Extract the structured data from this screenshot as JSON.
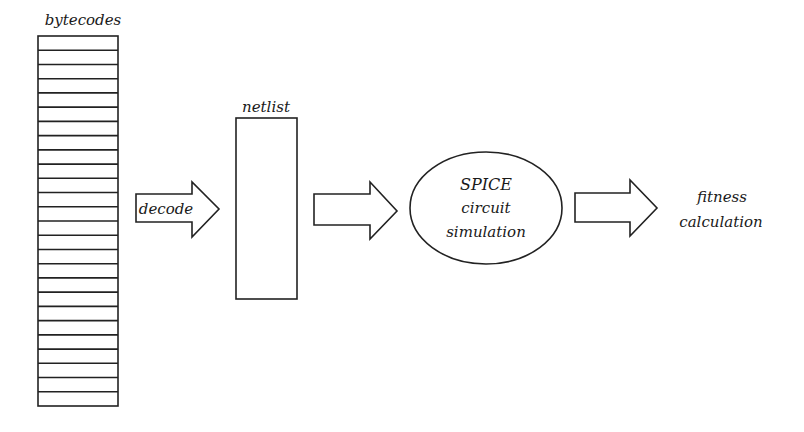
{
  "diagram": {
    "bytecodes": {
      "label": "bytecodes",
      "rows": 26
    },
    "decode_arrow": {
      "label": "decode"
    },
    "netlist": {
      "label": "netlist"
    },
    "spice": {
      "line1": "SPICE",
      "line2": "circuit",
      "line3": "simulation"
    },
    "fitness": {
      "line1": "fitness",
      "line2": "calculation"
    },
    "colors": {
      "stroke": "#222222",
      "background": "#ffffff",
      "text": "#1a1a1a"
    }
  }
}
